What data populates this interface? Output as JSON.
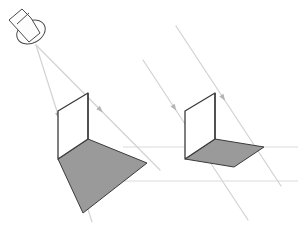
{
  "figure": {
    "background_color": "#ffffff",
    "width": 301,
    "height": 231
  },
  "palette": {
    "shadow_fill": "#9a9a9a",
    "shadow_fill_dark": "#8f8f8f",
    "object_fill": "#ffffff",
    "object_stroke": "#3a3a3a",
    "ray_stroke": "#d2d2d2",
    "ground_stroke": "#dcdcdc",
    "lamp_stroke": "#4a4a4a",
    "lamp_fill": "#fdfdfd",
    "arrow_fill": "#b4b4b4"
  },
  "strokes": {
    "object_width": 1.3,
    "ray_width": 1.2,
    "ground_width": 1.1,
    "lamp_width": 1.0,
    "shadow_edge_width": 1.0
  },
  "left_scene": {
    "name": "point-light-scene",
    "light": {
      "type": "point-source-lamp",
      "icon": "lamp-icon",
      "apex_x": 36,
      "apex_y": 45,
      "cone_top_x": 10,
      "cone_top_y": 12,
      "body_path": "M 9 20 L 22 9 L 31 18 L 40 33 L 29 42 Z",
      "bulb_cx": 31,
      "bulb_cy": 32,
      "bulb_rx": 15,
      "bulb_ry": 11,
      "bulb_rot": -28,
      "neck_path": "M 17 24 L 29 13"
    },
    "object": {
      "type": "vertical-parallelogram-card",
      "points": "58,111 88,93 88,139 58,159",
      "top_back_x": 58,
      "top_back_y": 111,
      "top_front_x": 88,
      "top_front_y": 93,
      "bot_front_x": 88,
      "bot_front_y": 139,
      "bot_back_x": 58,
      "bot_back_y": 159
    },
    "shadow": {
      "type": "enlarged-quadrilateral-shadow",
      "points": "58,159 88,139 147,163 83,213"
    },
    "rays": [
      {
        "name": "ray-to-top-front",
        "x1": 36,
        "x2": 160,
        "y1": 45,
        "y2": 170,
        "arrow_t": 0.52
      },
      {
        "name": "ray-to-top-back",
        "x1": 36,
        "x2": 92,
        "y1": 45,
        "y2": 222,
        "arrow_t": 0.4
      }
    ],
    "ground_lines": [
      {
        "name": "ground-line-far",
        "x1": 123,
        "y1": 147,
        "x2": 150,
        "y2": 147
      },
      {
        "name": "ground-line-near",
        "x1": 95,
        "y1": 181,
        "x2": 150,
        "y2": 181
      }
    ]
  },
  "right_scene": {
    "name": "parallel-light-scene",
    "object": {
      "type": "vertical-parallelogram-card",
      "points": "185,111 215,93 215,139 185,159",
      "top_back_x": 185,
      "top_back_y": 111,
      "top_front_x": 215,
      "top_front_y": 93,
      "bot_front_x": 215,
      "bot_front_y": 139,
      "bot_back_x": 185,
      "bot_back_y": 159
    },
    "shadow": {
      "type": "congruent-parallelogram-shadow",
      "points": "185,159 215,139 264,147 234,167"
    },
    "rays": [
      {
        "name": "parallel-ray-upper",
        "x1": 176,
        "x2": 281,
        "y1": 26,
        "y2": 186,
        "arrow_t": 0.45
      },
      {
        "name": "parallel-ray-lower",
        "x1": 143,
        "x2": 248,
        "y1": 60,
        "y2": 220,
        "arrow_t": 0.3
      }
    ],
    "ground_lines": [
      {
        "name": "ground-line-far",
        "x1": 150,
        "y1": 147,
        "x2": 298,
        "y2": 147
      },
      {
        "name": "ground-line-near",
        "x1": 150,
        "y1": 181,
        "x2": 298,
        "y2": 181
      }
    ]
  }
}
